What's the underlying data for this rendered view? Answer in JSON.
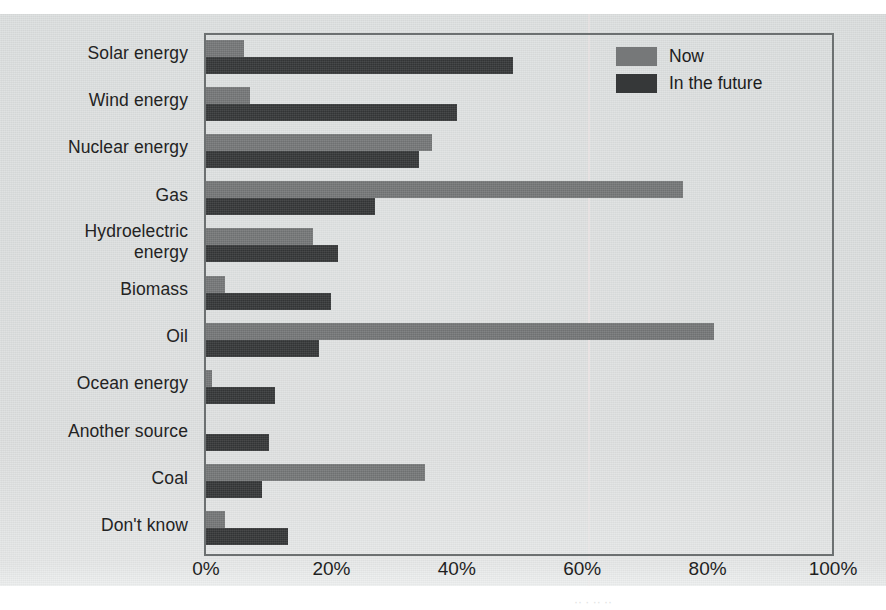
{
  "chart_data": {
    "type": "bar",
    "orientation": "horizontal",
    "title": "",
    "subtitle": "",
    "xlabel": "",
    "ylabel": "",
    "xlim": [
      0,
      100
    ],
    "xticks": [
      "0%",
      "20%",
      "40%",
      "60%",
      "80%",
      "100%"
    ],
    "xtick_values": [
      0,
      20,
      40,
      60,
      80,
      100
    ],
    "grid": false,
    "legend_position": "top-right",
    "categories": [
      "Solar energy",
      "Wind energy",
      "Nuclear energy",
      "Gas",
      "Hydroelectric\nenergy",
      "Biomass",
      "Oil",
      "Ocean energy",
      "Another source",
      "Coal",
      "Don't know"
    ],
    "series": [
      {
        "name": "Now",
        "color": "#767879",
        "values": [
          6,
          7,
          36,
          76,
          17,
          3,
          81,
          1,
          0,
          35,
          3
        ]
      },
      {
        "name": "In the future",
        "color": "#363839",
        "values": [
          49,
          40,
          34,
          27,
          21,
          20,
          18,
          11,
          10,
          9,
          13
        ]
      }
    ]
  },
  "legend": {
    "items": [
      {
        "label": "Now",
        "swatch": "now"
      },
      {
        "label": "In the future",
        "swatch": "future"
      }
    ]
  },
  "colors": {
    "now": "#767879",
    "future": "#363839",
    "frame": "#6c7071",
    "page_background": "#d9dbdb",
    "text": "#232323"
  },
  "caption_fragment": "··  ·   ·· ··"
}
